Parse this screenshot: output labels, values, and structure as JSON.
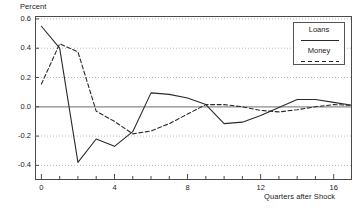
{
  "chart_data": {
    "type": "line",
    "title": "",
    "ylabel": "Percent",
    "xlabel": "Quarters after Shock",
    "xlim": [
      -0.35,
      17.0
    ],
    "ylim": [
      -0.5,
      0.62
    ],
    "xticks": [
      0,
      4,
      8,
      12,
      16
    ],
    "xtick_labels": [
      "0",
      "4",
      "8",
      "12",
      "16"
    ],
    "xminor_ticks": [
      1,
      2,
      3,
      5,
      6,
      7,
      9,
      10,
      11,
      13,
      14,
      15,
      17
    ],
    "yticks": [
      -0.4,
      -0.2,
      0.0,
      0.2,
      0.4,
      0.6
    ],
    "ytick_labels": [
      "-0.4",
      "-0.2",
      "0.0",
      "0.2",
      "0.4",
      "0.6"
    ],
    "grid": true,
    "grid_style": "dotted-horizontal",
    "zero_line": true,
    "legend_position": "top-right",
    "x": [
      0,
      1,
      2,
      3,
      4,
      5,
      6,
      7,
      8,
      9,
      10,
      11,
      12,
      13,
      14,
      15,
      16,
      17
    ],
    "series": [
      {
        "name": "Loans",
        "style": "solid",
        "color": "#2a2a2a",
        "values": [
          0.55,
          0.4,
          -0.38,
          -0.22,
          -0.27,
          -0.17,
          0.095,
          0.085,
          0.06,
          0.015,
          -0.115,
          -0.105,
          -0.06,
          -0.005,
          0.05,
          0.05,
          0.03,
          0.01
        ]
      },
      {
        "name": "Money",
        "style": "dashed",
        "color": "#2a2a2a",
        "values": [
          0.155,
          0.43,
          0.375,
          -0.03,
          -0.1,
          -0.185,
          -0.165,
          -0.115,
          -0.05,
          0.015,
          0.015,
          0.0,
          -0.025,
          -0.035,
          -0.02,
          0.0,
          0.015,
          0.01
        ]
      }
    ]
  },
  "legend": {
    "entries": [
      {
        "label": "Loans",
        "style": "solid"
      },
      {
        "label": "Money",
        "style": "dashed"
      }
    ]
  },
  "axes": {
    "ylabel_text": "Percent",
    "xlabel_text": "Quarters after Shock"
  }
}
